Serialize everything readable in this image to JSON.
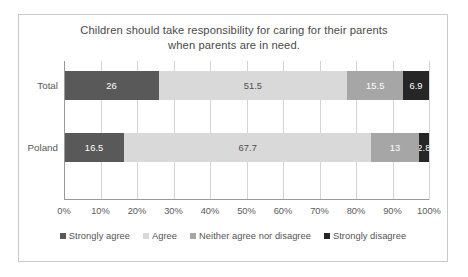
{
  "chart_data": {
    "type": "bar",
    "orientation": "horizontal",
    "stacked": true,
    "stack_mode": "percent",
    "title": "Children should take responsibility for caring for their parents when parents are in need.",
    "title_line1": "Children should take responsibility for caring for their parents",
    "title_line2": "when parents are in need.",
    "xlabel": "",
    "ylabel": "",
    "xlim": [
      0,
      100
    ],
    "grid": true,
    "legend_position": "bottom",
    "categories": [
      "Total",
      "Poland"
    ],
    "xtick_labels": [
      "0%",
      "10%",
      "20%",
      "30%",
      "40%",
      "50%",
      "60%",
      "70%",
      "80%",
      "90%",
      "100%"
    ],
    "xtick_values": [
      0,
      10,
      20,
      30,
      40,
      50,
      60,
      70,
      80,
      90,
      100
    ],
    "series": [
      {
        "name": "Strongly agree",
        "color": "#595959",
        "text_color": "#ffffff",
        "values": [
          26,
          16.5
        ],
        "labels": [
          "26",
          "16.5"
        ]
      },
      {
        "name": "Agree",
        "color": "#d9d9d9",
        "text_color": "#4f4f4f",
        "values": [
          51.5,
          67.7
        ],
        "labels": [
          "51.5",
          "67.7"
        ]
      },
      {
        "name": "Neither agree nor disagree",
        "color": "#a6a6a6",
        "text_color": "#ffffff",
        "values": [
          15.5,
          13
        ],
        "labels": [
          "15.5",
          "13"
        ]
      },
      {
        "name": "Strongly disagree",
        "color": "#262626",
        "text_color": "#ffffff",
        "values": [
          6.9,
          2.8
        ],
        "labels": [
          "6.9",
          "2.8"
        ]
      }
    ]
  },
  "colors": {
    "frame_border": "#c9c9c9",
    "gridline": "#d4d4d4",
    "axis": "#9a9a9a",
    "title_text": "#4a4a4a",
    "tick_text": "#5a5a5a",
    "legend_text": "#545454",
    "background": "#ffffff"
  }
}
